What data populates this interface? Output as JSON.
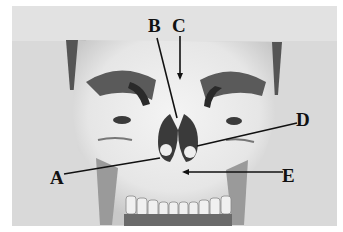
{
  "image": {
    "subject": "Frontal view of a human skull",
    "style": "grayscale photograph"
  },
  "labels": {
    "A": "A",
    "B": "B",
    "C": "C",
    "D": "D",
    "E": "E"
  },
  "colors": {
    "background": "#dcdcdc",
    "bone": "#ececec",
    "shadow": "#3a3a3a",
    "leader_line": "#111111"
  }
}
